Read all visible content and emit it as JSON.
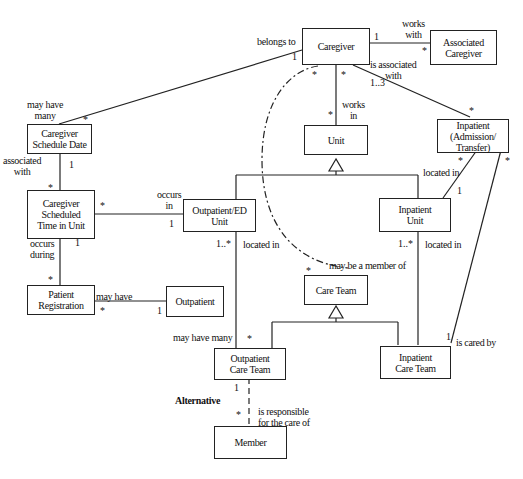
{
  "diagram": {
    "type": "UML class diagram",
    "classes": {
      "caregiver": "Caregiver",
      "associated_caregiver": "Associated\nCaregiver",
      "caregiver_schedule_date": "Caregiver\nSchedule Date",
      "unit": "Unit",
      "inpatient_admission": "Inpatient\n(Admission/\nTransfer)",
      "caregiver_scheduled_time": "Caregiver\nScheduled\nTime in Unit",
      "outpatient_ed_unit": "Outpatient/ED\nUnit",
      "inpatient_unit": "Inpatient\nUnit",
      "patient_registration": "Patient\nRegistration",
      "outpatient": "Outpatient",
      "care_team": "Care Team",
      "outpatient_care_team": "Outpatient\nCare Team",
      "inpatient_care_team": "Inpatient\nCare Team",
      "member": "Member"
    },
    "associations": {
      "belongs_to": "belongs to",
      "works_with": "works\nwith",
      "may_have_many_top": "may have\nmany",
      "is_associated_with": "is associated\nwith",
      "works_in": "works\nin",
      "associated_with": "associated\nwith",
      "occurs_in": "occurs\nin",
      "located_in_admission": "located in",
      "occurs_during": "occurs\nduring",
      "located_in_outpatient": "located in",
      "located_in_inpatient": "located in",
      "may_be_a_member_of": "may be a member of",
      "may_have": "may have",
      "may_have_many_bottom": "may have many",
      "is_cared_by": "is cared by",
      "is_responsible_for": "is responsible\nfor the care of",
      "alternative": "Alternative"
    },
    "multiplicities": {
      "one": "1",
      "many": "*",
      "one_to_many": "1..*",
      "one_to_three": "1..3"
    }
  }
}
